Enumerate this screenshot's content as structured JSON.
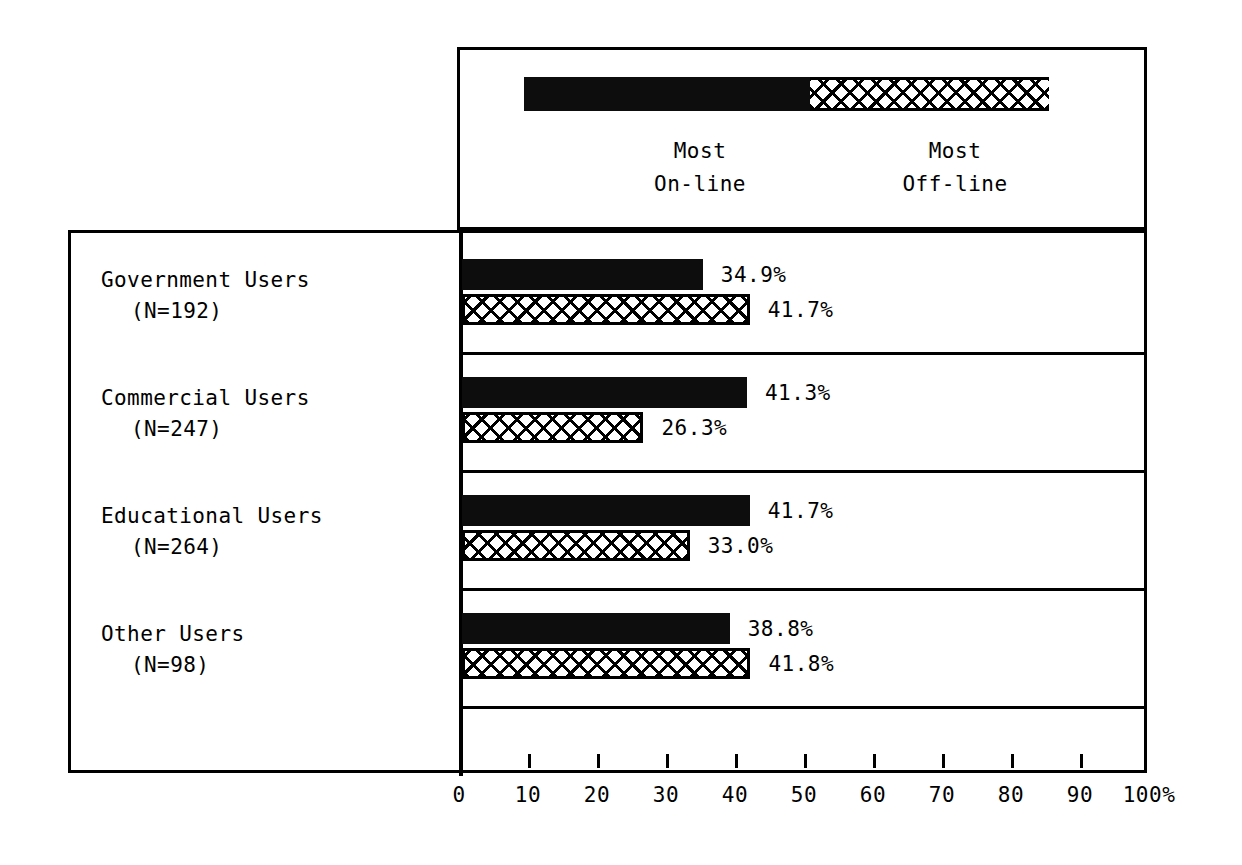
{
  "legend": {
    "items": [
      {
        "label_line1": "Most",
        "label_line2": "On-line",
        "pattern": "solid"
      },
      {
        "label_line1": "Most",
        "label_line2": "Off-line",
        "pattern": "crosshatch"
      }
    ]
  },
  "axis": {
    "ticks": [
      0,
      10,
      20,
      30,
      40,
      50,
      60,
      70,
      80,
      90,
      100
    ],
    "tick_labels": [
      "0",
      "10",
      "20",
      "30",
      "40",
      "50",
      "60",
      "70",
      "80",
      "90",
      "100%"
    ]
  },
  "rows": [
    {
      "name": "Government Users",
      "n_label": "(N=192)",
      "online_value": "34.9%",
      "offline_value": "41.7%"
    },
    {
      "name": "Commercial Users",
      "n_label": "(N=247)",
      "online_value": "41.3%",
      "offline_value": "26.3%"
    },
    {
      "name": "Educational Users",
      "n_label": "(N=264)",
      "online_value": "41.7%",
      "offline_value": "33.0%"
    },
    {
      "name": "Other Users",
      "n_label": "(N=98)",
      "online_value": "38.8%",
      "offline_value": "41.8%"
    }
  ],
  "chart_data": {
    "type": "bar",
    "orientation": "horizontal",
    "title": "",
    "xlabel": "",
    "ylabel": "",
    "xlim": [
      0,
      100
    ],
    "xticks": [
      0,
      10,
      20,
      30,
      40,
      50,
      60,
      70,
      80,
      90,
      100
    ],
    "xtick_labels": [
      "0",
      "10",
      "20",
      "30",
      "40",
      "50",
      "60",
      "70",
      "80",
      "90",
      "100%"
    ],
    "grid": false,
    "legend_position": "top",
    "categories": [
      "Government Users (N=192)",
      "Commercial Users (N=247)",
      "Educational Users (N=264)",
      "Other Users (N=98)"
    ],
    "series": [
      {
        "name": "Most On-line",
        "values": [
          34.9,
          41.3,
          41.7,
          38.8
        ]
      },
      {
        "name": "Most Off-line",
        "values": [
          41.7,
          26.3,
          33.0,
          41.8
        ]
      }
    ],
    "colors": {
      "most_online": "#0d0d0d",
      "most_offline": "#ffffff",
      "outline": "#000000"
    }
  }
}
